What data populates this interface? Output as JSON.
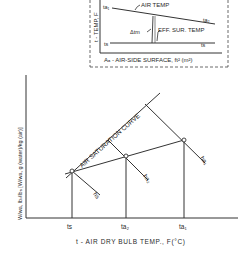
{
  "inset": {
    "ylabel": "t - TEMP, F",
    "xlabel": "Aₐ - AIR-SIDE SURFACE, ft² (m²)",
    "air_temp_label": "AIR TEMP",
    "eff_temp_label": "EFF. SUR. TEMP",
    "delta_label": "Δtm",
    "ta1": "ta₁",
    "ta2": "ta₂",
    "ts_left": "ts",
    "ts_right": "ts"
  },
  "main": {
    "ylabel": "W/wa, lbᵥ/lbₐ [W/wa, g (water)/kg (air)]",
    "xlabel": "t - AIR DRY BULB TEMP., F(°C)",
    "curve_label": "AIR SATURATION CURVE",
    "x_ticks": [
      "ts",
      "ta₂",
      "ta₁"
    ],
    "enthalpy_labels": [
      "hs",
      "ha₂",
      "ha₁"
    ]
  },
  "colors": {
    "line": "#333333",
    "background": "#ffffff"
  }
}
